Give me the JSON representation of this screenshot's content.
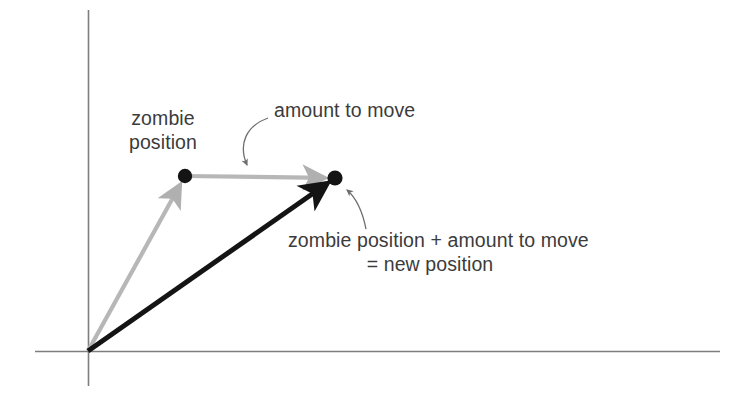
{
  "figure": {
    "type": "vector-addition-diagram",
    "background_color": "#ffffff",
    "axis_color": "#7a7a7a",
    "vector_gray_color": "#b3b3b3",
    "vector_black_color": "#1a1a1a",
    "dot_color": "#141414",
    "text_color": "#3b3b3b",
    "leader_color": "#6e6e6e"
  },
  "axes": {
    "origin": {
      "x": 88,
      "y": 351
    },
    "x_axis": {
      "x1": 35,
      "y1": 351,
      "x2": 720,
      "y2": 351
    },
    "y_axis": {
      "x1": 88,
      "y1": 10,
      "x2": 88,
      "y2": 386
    }
  },
  "points": [
    {
      "name": "zombie-position-point",
      "x": 185,
      "y": 176
    },
    {
      "name": "new-position-point",
      "x": 335,
      "y": 178
    }
  ],
  "vectors": [
    {
      "name": "zombie-position-vector",
      "style": "gray",
      "from": {
        "x": 88,
        "y": 351
      },
      "to": {
        "x": 185,
        "y": 176
      }
    },
    {
      "name": "amount-to-move-vector",
      "style": "gray",
      "from": {
        "x": 185,
        "y": 176
      },
      "to": {
        "x": 335,
        "y": 178
      }
    },
    {
      "name": "new-position-vector",
      "style": "black",
      "from": {
        "x": 88,
        "y": 351
      },
      "to": {
        "x": 335,
        "y": 178
      }
    }
  ],
  "labels": {
    "zombie_position": {
      "line1": "zombie",
      "line2": "position"
    },
    "amount_to_move": "amount to move",
    "new_position": {
      "line1": "zombie position + amount to move",
      "line2": "= new position"
    }
  },
  "leaders": [
    {
      "name": "amount-to-move-leader",
      "path": "M 268,118 C 246,126 238,144 247,165",
      "arrow_at": {
        "x": 247,
        "y": 167
      }
    },
    {
      "name": "new-position-leader",
      "path": "M 366,229 C 362,209 354,196 347,190",
      "arrow_at": {
        "x": 346,
        "y": 188
      }
    }
  ]
}
